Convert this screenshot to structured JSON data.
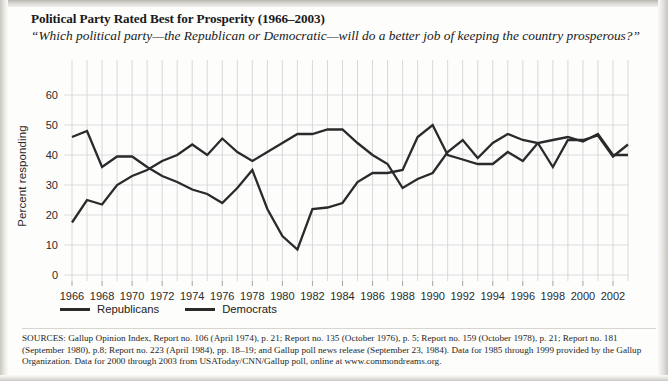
{
  "page": {
    "title": "Political Party Rated Best for Prosperity (1966–2003)",
    "subtitle": "“Which political party—the Republican or Democratic—will do a better job of keeping the country prosperous?”",
    "sources": "SOURCES: Gallup Opinion Index, Report no. 106 (April 1974), p. 21; Report no. 135 (October 1976), p. 5; Report no. 159 (October 1978), p. 21; Report no. 181 (September 1980), p.8; Report no. 223 (April 1984), pp. 18–19; and Gallup poll news release (September 23, 1984). Data for 1985 through 1999 provided by the Gallup Organization. Data for 2000 through 2003 from USAToday/CNN/Gallup poll, online at www.commondreams.org."
  },
  "legend": {
    "items": [
      {
        "label": "Republicans",
        "color": "#2a2a2a"
      },
      {
        "label": "Democrats",
        "color": "#2a2a2a"
      }
    ]
  },
  "chart_data": {
    "type": "line",
    "title": "Political Party Rated Best for Prosperity (1966–2003)",
    "subtitle": "“Which political party—the Republican or Democratic—will do a better job of keeping the country prosperous?”",
    "xlabel": "",
    "ylabel": "Percent responding",
    "xlim": [
      1966,
      2003
    ],
    "ylim": [
      0,
      65
    ],
    "yticks": [
      0,
      10,
      20,
      30,
      40,
      50,
      60
    ],
    "xticks": [
      1966,
      1968,
      1970,
      1972,
      1974,
      1976,
      1978,
      1980,
      1982,
      1984,
      1986,
      1988,
      1990,
      1992,
      1994,
      1996,
      1998,
      2000,
      2002
    ],
    "grid": true,
    "grid_interval_x": 1,
    "legend_position": "below-axis",
    "x": [
      1966,
      1967,
      1968,
      1969,
      1970,
      1971,
      1972,
      1973,
      1974,
      1975,
      1976,
      1977,
      1978,
      1979,
      1980,
      1981,
      1982,
      1983,
      1984,
      1985,
      1986,
      1987,
      1988,
      1989,
      1990,
      1991,
      1992,
      1993,
      1994,
      1995,
      1996,
      1997,
      1998,
      1999,
      2000,
      2001,
      2002,
      2003
    ],
    "series": [
      {
        "name": "Republicans",
        "color": "#2a2a2a",
        "values": [
          46,
          48,
          36,
          39.5,
          39.5,
          36,
          33,
          31,
          28.5,
          27,
          24,
          29,
          35,
          22,
          13,
          8.5,
          22,
          22.5,
          24,
          31,
          34,
          34,
          35,
          46,
          50,
          40,
          38.5,
          37,
          37,
          41,
          38,
          44,
          45,
          46,
          44.5,
          47,
          40,
          40
        ]
      },
      {
        "name": "Democrats",
        "color": "#2a2a2a",
        "values": [
          17.5,
          25,
          23.5,
          30,
          33,
          35,
          38,
          40,
          43.5,
          40,
          45.5,
          41,
          38,
          41,
          44,
          47,
          47,
          48.5,
          48.5,
          44,
          40,
          37,
          29,
          32,
          34,
          41,
          45,
          39,
          44,
          47,
          45,
          44,
          36,
          45,
          45,
          46.5,
          39.5,
          43.5
        ]
      }
    ]
  }
}
